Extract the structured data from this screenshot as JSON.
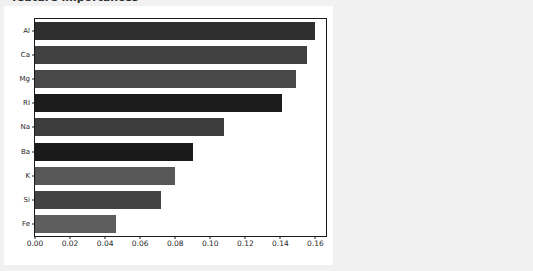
{
  "window": {
    "background_color": "#f1f1f1",
    "canvas_color": "#ffffff"
  },
  "title_fragment": "feature importances",
  "chart_data": {
    "type": "bar",
    "orientation": "horizontal",
    "title": "",
    "xlabel": "",
    "ylabel": "",
    "categories": [
      "Al",
      "Ca",
      "Mg",
      "RI",
      "Na",
      "Ba",
      "K",
      "Si",
      "Fe"
    ],
    "values": [
      0.16,
      0.155,
      0.149,
      0.141,
      0.108,
      0.09,
      0.08,
      0.072,
      0.046
    ],
    "bar_colors": [
      "#2f2f2f",
      "#414141",
      "#484848",
      "#1c1c1c",
      "#3d3d3d",
      "#1a1a1a",
      "#575757",
      "#434343",
      "#5e5e5e"
    ],
    "xlim": [
      0.0,
      0.166
    ],
    "ylim_categories": 9,
    "xticks": [
      0.0,
      0.02,
      0.04,
      0.06,
      0.08,
      0.1,
      0.12,
      0.14,
      0.16
    ],
    "xtick_labels": [
      "0.00",
      "0.02",
      "0.04",
      "0.06",
      "0.08",
      "0.10",
      "0.12",
      "0.14",
      "0.16"
    ],
    "grid": false,
    "legend": null,
    "legend_position": "none",
    "sorted": "descending"
  }
}
